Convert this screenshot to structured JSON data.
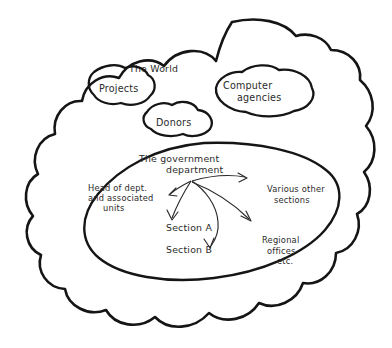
{
  "diagram": {
    "title_label": "The World",
    "outer_region": {
      "name": "the-world-cloud",
      "label": "The World"
    },
    "bubbles": [
      {
        "id": "projects",
        "label": "Projects"
      },
      {
        "id": "donors",
        "label": "Donors"
      },
      {
        "id": "computer-agencies",
        "label_line1": "Computer",
        "label_line2": "agencies"
      }
    ],
    "inner_region": {
      "name": "government-department-ellipse",
      "label_line1": "The government",
      "label_line2": "department"
    },
    "nodes": [
      {
        "id": "head-of-dept",
        "lines": [
          "Head of dept.",
          "and associated",
          "units"
        ]
      },
      {
        "id": "various-other-sections",
        "lines": [
          "Various other",
          "sections"
        ]
      },
      {
        "id": "section-a",
        "lines": [
          "Section A"
        ]
      },
      {
        "id": "section-b",
        "lines": [
          "Section B"
        ]
      },
      {
        "id": "regional-offices",
        "lines": [
          "Regional",
          "offices",
          "etc."
        ]
      }
    ],
    "arrows": [
      {
        "id": "arrow-to-head-of-dept",
        "from": "government-department",
        "to": "head-of-dept"
      },
      {
        "id": "arrow-to-section-a",
        "from": "government-department",
        "to": "section-a"
      },
      {
        "id": "arrow-to-section-b",
        "from": "government-department",
        "to": "section-b"
      },
      {
        "id": "arrow-to-various-other-sections",
        "from": "government-department",
        "to": "various-other-sections"
      },
      {
        "id": "arrow-to-regional-offices",
        "from": "government-department",
        "to": "regional-offices"
      }
    ],
    "colors": {
      "ink": "#151515",
      "arrow_ink": "#2a2a2a",
      "text_ink": "#2b2b2b",
      "background": "#ffffff"
    }
  }
}
